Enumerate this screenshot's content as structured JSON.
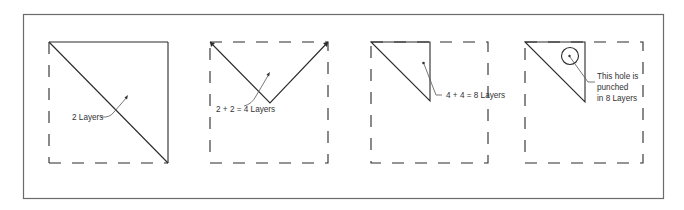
{
  "figure": {
    "panels": [
      {
        "id": "panel-1",
        "step": 1,
        "label": "2 Layers",
        "fold": "diagonal fold: square folded into triangle"
      },
      {
        "id": "panel-2",
        "step": 2,
        "label": "2 + 2 = 4 Layers",
        "fold": "triangle folded in half"
      },
      {
        "id": "panel-3",
        "step": 3,
        "label": "4 + 4 = 8 Layers",
        "fold": "folded again into small triangle"
      },
      {
        "id": "panel-4",
        "step": 4,
        "label_lines": [
          "This hole is",
          "punched",
          "in 8 Layers"
        ],
        "fold": "hole punched through folded triangle"
      }
    ]
  },
  "colors": {
    "frame": "#6b6b6b",
    "lines": "#2a2a2a",
    "text": "#333333"
  }
}
